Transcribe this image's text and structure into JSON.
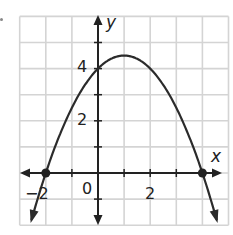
{
  "chart_data": {
    "type": "line",
    "title": "",
    "xlabel": "x",
    "ylabel": "y",
    "xlim": [
      -3,
      5
    ],
    "ylim": [
      -2,
      6
    ],
    "grid": true,
    "x_tick_labels": [
      {
        "value": -2,
        "label": "−2"
      },
      {
        "value": 0,
        "label": "0"
      },
      {
        "value": 2,
        "label": "2"
      }
    ],
    "y_tick_labels": [
      {
        "value": 2,
        "label": "2"
      },
      {
        "value": 4,
        "label": "4"
      }
    ],
    "series": [
      {
        "name": "parabola",
        "equation": "y = -0.5(x + 2)(x - 4)",
        "x": [
          -2.5,
          -2,
          -1,
          0,
          1,
          2,
          3,
          4,
          4.5
        ],
        "values": [
          -1.625,
          0,
          2.5,
          4,
          4.5,
          4,
          2.5,
          0,
          -1.625
        ]
      }
    ],
    "annotations": [
      {
        "type": "point",
        "x": -2,
        "y": 0
      },
      {
        "type": "point",
        "x": 4,
        "y": 0
      }
    ]
  },
  "labels": {
    "x_axis": "x",
    "y_axis": "y",
    "origin": "0",
    "tick_x_neg2": "−2",
    "tick_x_2": "2",
    "tick_y_2": "2",
    "tick_y_4": "4"
  },
  "colors": {
    "grid": "#d4d4d4",
    "axis": "#222222",
    "curve": "#2b2b2b",
    "point": "#222222"
  }
}
